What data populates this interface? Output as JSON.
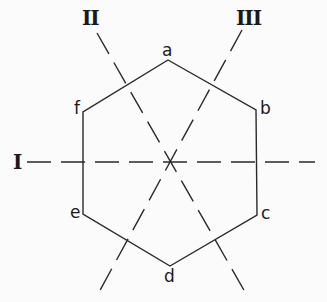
{
  "diagram": {
    "type": "hexagon-symmetry-axes",
    "stroke_color": "#2a2a2a",
    "background": "#fbfbfb",
    "vertices": [
      {
        "label": "a",
        "x": 168,
        "y": 60,
        "label_x": 162,
        "label_y": 42
      },
      {
        "label": "b",
        "x": 256,
        "y": 110,
        "label_x": 260,
        "label_y": 100
      },
      {
        "label": "c",
        "x": 257,
        "y": 215,
        "label_x": 261,
        "label_y": 205
      },
      {
        "label": "d",
        "x": 170,
        "y": 266,
        "label_x": 164,
        "label_y": 268
      },
      {
        "label": "e",
        "x": 83,
        "y": 214,
        "label_x": 70,
        "label_y": 204
      },
      {
        "label": "f",
        "x": 83,
        "y": 112,
        "label_x": 74,
        "label_y": 100
      }
    ],
    "axes": [
      {
        "label": "I",
        "x1": 27,
        "y1": 162,
        "x2": 315,
        "y2": 162,
        "label_x": 13,
        "label_y": 152
      },
      {
        "label": "II",
        "x1": 97,
        "y1": 33,
        "x2": 245,
        "y2": 292,
        "label_x": 82,
        "label_y": 8
      },
      {
        "label": "III",
        "x1": 242,
        "y1": 30,
        "x2": 98,
        "y2": 294,
        "label_x": 236,
        "label_y": 8
      }
    ]
  }
}
